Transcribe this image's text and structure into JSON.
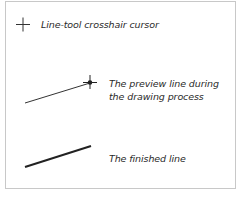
{
  "diagram": {
    "items": [
      {
        "id": "crosshair",
        "icon": "crosshair-icon",
        "label": "Line-tool crosshair cursor"
      },
      {
        "id": "preview",
        "icon": "preview-line-icon",
        "label_lines": [
          "The preview line during",
          "the drawing process"
        ]
      },
      {
        "id": "finished",
        "icon": "finished-line-icon",
        "label": "The finished line"
      }
    ],
    "colors": {
      "border": "#c8c8c8",
      "line": "#222222",
      "text": "#2a2a2a"
    }
  }
}
